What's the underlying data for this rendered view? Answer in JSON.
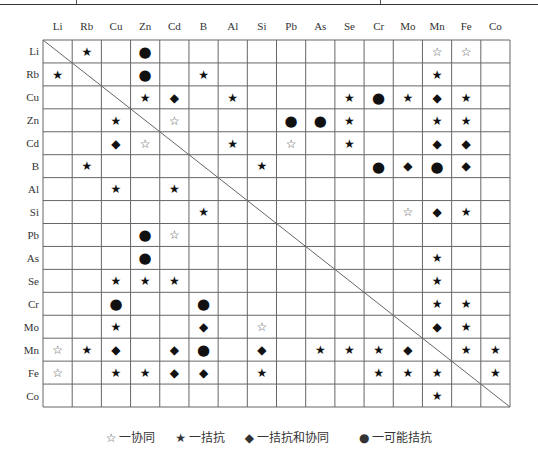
{
  "elements": [
    "Li",
    "Rb",
    "Cu",
    "Zn",
    "Cd",
    "B",
    "Al",
    "Si",
    "Pb",
    "As",
    "Se",
    "Cr",
    "Mo",
    "Mn",
    "Fe",
    "Co"
  ],
  "symbols": {
    "S": {
      "glyph": "☆",
      "meaning": "协同",
      "name": "synergy-open-star-icon",
      "color": "#555555"
    },
    "A": {
      "glyph": "★",
      "meaning": "拮抗",
      "name": "antagonism-filled-star-icon",
      "color": "#111111"
    },
    "D": {
      "glyph": "◆",
      "meaning": "拮抗和协同",
      "name": "antagonism-and-synergy-diamond-icon",
      "color": "#111111"
    },
    "C": {
      "glyph": "●",
      "meaning": "可能拮抗",
      "name": "possible-antagonism-circle-icon",
      "color": "#111111"
    }
  },
  "matrix": {
    "Li": {
      "Rb": "A",
      "Zn": "C",
      "Mn": "S",
      "Fe": "S"
    },
    "Rb": {
      "Li": "A",
      "Zn": "C",
      "B": "A",
      "Mn": "A"
    },
    "Cu": {
      "Zn": "A",
      "Cd": "D",
      "Al": "A",
      "Se": "A",
      "Cr": "C",
      "Mo": "A",
      "Mn": "D",
      "Fe": "A"
    },
    "Zn": {
      "Cu": "A",
      "Cd": "S",
      "Pb": "C",
      "As": "C",
      "Se": "A",
      "Mn": "A",
      "Fe": "A"
    },
    "Cd": {
      "Cu": "D",
      "Zn": "S",
      "Al": "A",
      "Pb": "S",
      "Se": "A",
      "Mn": "D",
      "Fe": "D"
    },
    "B": {
      "Rb": "A",
      "Si": "A",
      "Cr": "C",
      "Mo": "D",
      "Mn": "C",
      "Fe": "D"
    },
    "Al": {
      "Cu": "A",
      "Cd": "A"
    },
    "Si": {
      "B": "A",
      "Mo": "S",
      "Mn": "D",
      "Fe": "A"
    },
    "Pb": {
      "Zn": "C",
      "Cd": "S"
    },
    "As": {
      "Zn": "C",
      "Mn": "A"
    },
    "Se": {
      "Cu": "A",
      "Zn": "A",
      "Cd": "A",
      "Mn": "A"
    },
    "Cr": {
      "Cu": "C",
      "B": "C",
      "Mn": "A",
      "Fe": "A"
    },
    "Mo": {
      "Cu": "A",
      "B": "D",
      "Si": "S",
      "Mn": "D",
      "Fe": "A"
    },
    "Mn": {
      "Li": "S",
      "Rb": "A",
      "Cu": "D",
      "Cd": "D",
      "B": "C",
      "Si": "D",
      "As": "A",
      "Se": "A",
      "Cr": "A",
      "Mo": "D",
      "Fe": "A",
      "Co": "A"
    },
    "Fe": {
      "Li": "S",
      "Cu": "A",
      "Zn": "A",
      "Cd": "D",
      "B": "D",
      "Si": "A",
      "Cr": "A",
      "Mo": "A",
      "Mn": "A",
      "Co": "A"
    },
    "Co": {
      "Mn": "A"
    }
  },
  "legend": [
    {
      "key": "S",
      "glyph": "☆",
      "label": "一协同"
    },
    {
      "key": "A",
      "glyph": "★",
      "label": "一拮抗"
    },
    {
      "key": "D",
      "glyph": "◆",
      "label": "一拮抗和协同"
    },
    {
      "key": "C",
      "glyph": "●",
      "label": "一可能拮抗"
    }
  ]
}
